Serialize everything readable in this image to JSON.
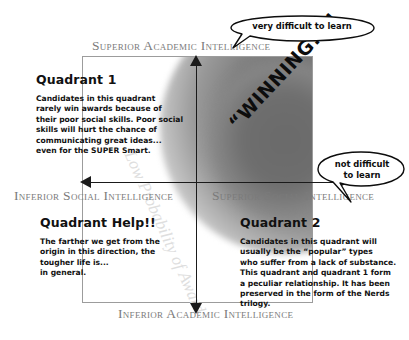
{
  "diagram": {
    "axes": {
      "top_label": "Superior Academic Intelligence",
      "bottom_label": "Inferior Academic Intelligence",
      "left_label": "Inferior Social Intelligence",
      "right_label": "Superior Social Intelligence"
    },
    "quadrants": [
      {
        "id": "quadrant-1",
        "title": "Quadrant 1",
        "body": "Candidates in this quadrant\nrarely win awards because of\ntheir poor social skills.  Poor social\nskills will hurt the chance of\ncommunicating great ideas...\neven for the SUPER Smart."
      },
      {
        "id": "quadrant-help",
        "title": "Quadrant Help!!",
        "body": "The farther we get from the\norigin in this direction, the\ntougher life is...\nin general."
      },
      {
        "id": "quadrant-2",
        "title": "Quadrant 2",
        "body": "Candidates in this quadrant will\nusually be the “popular” types\nwho suffer from a lack of substance.\nThis quadrant and quadrant 1 form\na peculiar relationship.  It has been\npreserved in the form of the Nerds\ntrilogy."
      }
    ],
    "callouts": [
      {
        "id": "callout-very-difficult",
        "text": "very difficult to learn"
      },
      {
        "id": "callout-not-difficult",
        "text": "not difficult\nto learn"
      }
    ],
    "winning_label": "“WINNING!!!!",
    "watermark": "Low Probability of Award",
    "colors": {
      "axis": "#1a1a1a",
      "axis_label": "#7b7b7b",
      "frame": "#9c9c9c",
      "text": "#111111",
      "blob_core": "#6f6f6f",
      "watermark": "#dedede",
      "background": "#ffffff"
    }
  }
}
